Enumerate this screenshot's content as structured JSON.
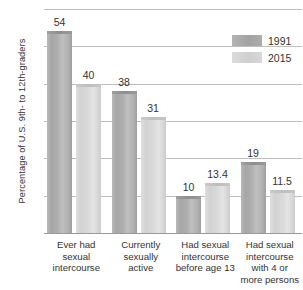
{
  "chart_data": {
    "type": "bar",
    "title": "",
    "xlabel": "",
    "ylabel": "Percentage of U.S. 9th- to 12th-graders",
    "ylim": [
      0,
      60
    ],
    "yticks": [
      0,
      10,
      20,
      30,
      40,
      50,
      60
    ],
    "ytick_labels": [
      "0",
      "10",
      "20",
      "30",
      "40",
      "50",
      "60"
    ],
    "grid": true,
    "legend_position": "top-right",
    "categories": [
      "Ever had sexual intercourse",
      "Currently sexually active",
      "Had sexual intercourse before age 13",
      "Had sexual intercourse with 4 or more persons"
    ],
    "category_lines": [
      [
        "Ever had",
        "sexual",
        "intercourse"
      ],
      [
        "Currently",
        "sexually",
        "active"
      ],
      [
        "Had sexual",
        "intercourse",
        "before age 13"
      ],
      [
        "Had sexual",
        "intercourse",
        "with 4 or",
        "more persons"
      ]
    ],
    "series": [
      {
        "name": "1991",
        "color": "#a6a6a6",
        "values": [
          54,
          38,
          10,
          19
        ],
        "value_labels": [
          "54",
          "38",
          "10",
          "19"
        ]
      },
      {
        "name": "2015",
        "color": "#d5d5d5",
        "values": [
          40,
          31,
          13.4,
          11.5
        ],
        "value_labels": [
          "40",
          "31",
          "13.4",
          "11.5"
        ]
      }
    ]
  },
  "legend": {
    "items": [
      {
        "label": "1991",
        "swatch": "s1991"
      },
      {
        "label": "2015",
        "swatch": "s2015"
      }
    ]
  }
}
